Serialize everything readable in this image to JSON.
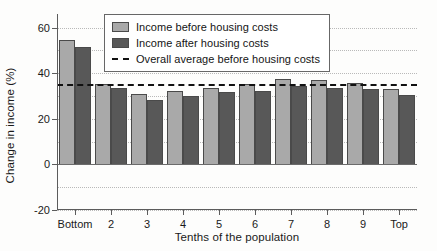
{
  "chart_data": {
    "type": "bar",
    "title": "",
    "xlabel": "Tenths of the population",
    "ylabel": "Change in income (%)",
    "categories": [
      "Bottom",
      "2",
      "3",
      "4",
      "5",
      "6",
      "7",
      "8",
      "9",
      "Top"
    ],
    "series": [
      {
        "name": "Income before housing costs",
        "color": "#a9a9a9",
        "values": [
          54.5,
          35.2,
          30.8,
          32.3,
          33.6,
          35.2,
          37.6,
          37.2,
          35.8,
          33.0
        ]
      },
      {
        "name": "Income after housing costs",
        "color": "#585858",
        "values": [
          51.5,
          33.6,
          28.4,
          30.2,
          31.6,
          32.4,
          34.2,
          33.6,
          33.2,
          30.4
        ]
      }
    ],
    "reference_lines": [
      {
        "name": "Overall average before housing costs",
        "value": 35.5,
        "style": "dashed",
        "color": "#111111"
      }
    ],
    "ylim": [
      -20,
      66
    ],
    "yticks": [
      -20,
      0,
      20,
      40,
      60
    ],
    "ytick_labels": [
      "-20",
      "0",
      "20",
      "40",
      "60"
    ],
    "gridlines": [
      -10,
      10,
      30,
      50,
      60
    ],
    "grid": true,
    "legend_position": "top-center"
  },
  "legend": {
    "items": [
      {
        "label": "Income before housing costs",
        "marker": "swatch-light"
      },
      {
        "label": "Income after housing costs",
        "marker": "swatch-dark"
      },
      {
        "label": "Overall average before housing costs",
        "marker": "dashed-line"
      }
    ]
  }
}
